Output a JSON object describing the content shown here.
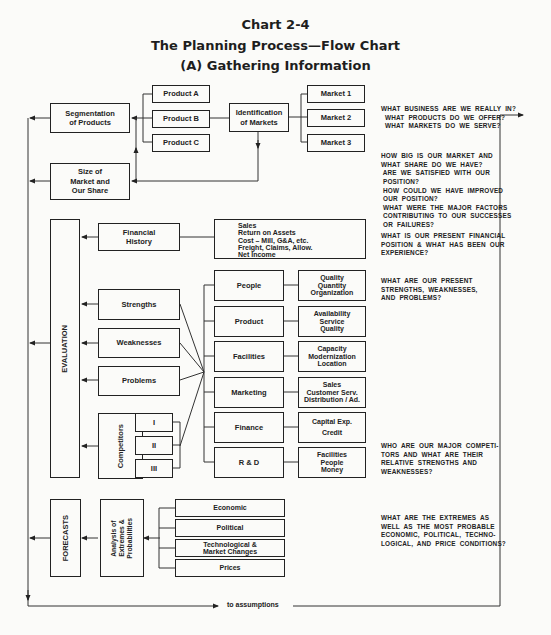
{
  "header": {
    "chart_number": "Chart 2-4",
    "title": "The Planning Process—Flow Chart",
    "subtitle": "(A) Gathering Information"
  },
  "nodes": {
    "segmentation": "Segmentation\nof Products",
    "product_a": "Product A",
    "product_b": "Product B",
    "product_c": "Product C",
    "identification": "Identification\nof Markets",
    "market_1": "Market 1",
    "market_2": "Market 2",
    "market_3": "Market 3",
    "size_share": "Size of\nMarket and\nOur Share",
    "evaluation": "EVALUATION",
    "financial_history": "Financial\nHistory",
    "financial_items": "Sales\nReturn on Assets\nCost – Mill, G&A, etc.\nFreight, Claims, Allow.\nNet Income",
    "strengths": "Strengths",
    "weaknesses": "Weaknesses",
    "problems": "Problems",
    "competitors": "Competitors",
    "comp_1": "I",
    "comp_2": "II",
    "comp_3": "III",
    "people": "People",
    "people_detail": "Quality\nQuantity\nOrganization",
    "product": "Product",
    "product_detail": "Availability\nService\nQuality",
    "facilities": "Facilities",
    "facilities_detail": "Capacity\nModernization\nLocation",
    "marketing": "Marketing",
    "marketing_detail": "Sales\nCustomer Serv.\nDistribution / Ad.",
    "finance": "Finance",
    "finance_detail": "Capital Exp.\nCredit",
    "rnd": "R & D",
    "rnd_detail": "Facilities\nPeople\nMoney",
    "forecasts": "FORECASTS",
    "analysis": "Analysis of\nExtremes &\nProbabilities",
    "economic": "Economic",
    "political": "Political",
    "technological": "Technological &\nMarket Changes",
    "prices": "Prices"
  },
  "questions": {
    "business": "WHAT  BUSINESS  ARE  WE  REALLY  IN?\n  WHAT  PRODUCTS  DO  WE  OFFER?\n  WHAT  MARKETS  DO  WE  SERVE?",
    "market_size": "HOW  BIG  IS  OUR  MARKET  AND\nWHAT  SHARE  DO  WE  HAVE?\n ARE  WE  SATISFIED  WITH  OUR\n POSITION?\n HOW  COULD  WE  HAVE  IMPROVED\n OUR  POSITION?\n WHAT  WERE  THE  MAJOR  FACTORS\n CONTRIBUTING  TO  OUR  SUCCESSES\n OR  FAILURES?",
    "financial": "WHAT  IS  OUR  PRESENT  FINANCIAL\nPOSITION  &  WHAT  HAS  BEEN  OUR\nEXPERIENCE?",
    "strengths": "WHAT  ARE  OUR  PRESENT\nSTRENGTHS,  WEAKNESSES,\nAND  PROBLEMS?",
    "competitors": "WHO  ARE  OUR  MAJOR  COMPETI-\nTORS  AND  WHAT  ARE  THEIR\nRELATIVE  STRENGTHS  AND\nWEAKNESSES?",
    "extremes": "WHAT  ARE  THE  EXTREMES  AS\nWELL  AS  THE  MOST  PROBABLE\nECONOMIC,  POLITICAL,  TECHNO-\nLOGICAL,  AND  PRICE  CONDITIONS?"
  },
  "footer": {
    "to_assumptions": "to assumptions"
  }
}
